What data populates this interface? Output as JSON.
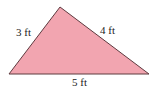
{
  "diagram": {
    "shape": "triangle",
    "fill_color": "#f2a5b0",
    "stroke_color": "#5e3a3f",
    "vertices": [
      [
        60,
        7
      ],
      [
        9,
        74
      ],
      [
        149,
        74
      ]
    ],
    "sides": [
      {
        "name": "left",
        "label": "3 ft"
      },
      {
        "name": "right",
        "label": "4 ft"
      },
      {
        "name": "base",
        "label": "5 ft"
      }
    ]
  }
}
